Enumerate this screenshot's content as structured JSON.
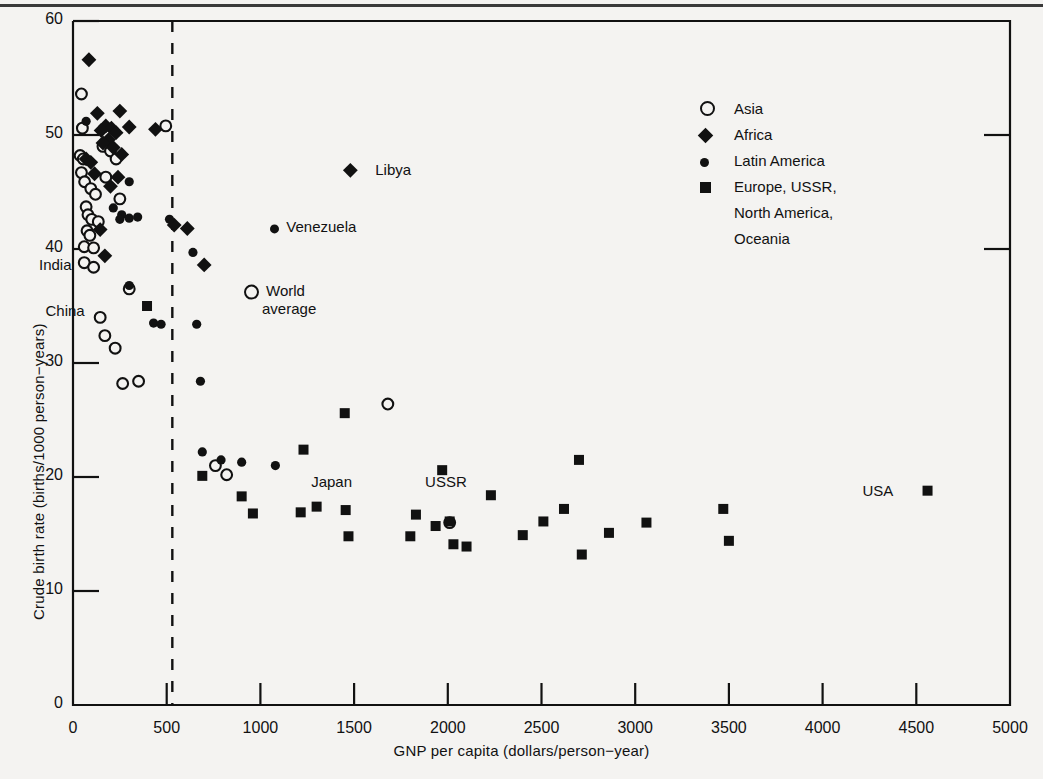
{
  "chart_data": {
    "type": "scatter",
    "title": "",
    "xlabel": "GNP per capita (dollars/person−year)",
    "ylabel": "Crude birth rate (births/1000 person−years)",
    "xlim": [
      0,
      5000
    ],
    "ylim": [
      0,
      60
    ],
    "xticks": [
      0,
      500,
      1000,
      1500,
      2000,
      2500,
      3000,
      3500,
      4000,
      4500,
      5000
    ],
    "yticks": [
      0,
      10,
      20,
      30,
      40,
      50,
      60
    ],
    "grid": false,
    "legend_position": "upper-right",
    "reference_line": {
      "orientation": "vertical",
      "x": 530,
      "style": "dashed"
    },
    "series": [
      {
        "name": "Asia",
        "marker": "open-circle",
        "points": [
          [
            45,
            53.6
          ],
          [
            50,
            50.6
          ],
          [
            38,
            48.2
          ],
          [
            55,
            47.9
          ],
          [
            45,
            46.7
          ],
          [
            62,
            45.9
          ],
          [
            95,
            45.3
          ],
          [
            120,
            44.8
          ],
          [
            70,
            43.7
          ],
          [
            80,
            43.0
          ],
          [
            100,
            42.6
          ],
          [
            135,
            42.4
          ],
          [
            75,
            41.6
          ],
          [
            90,
            41.2
          ],
          [
            60,
            40.2
          ],
          [
            110,
            40.1
          ],
          [
            60,
            38.8
          ],
          [
            110,
            38.4
          ],
          [
            160,
            49.0
          ],
          [
            200,
            48.6
          ],
          [
            230,
            47.9
          ],
          [
            175,
            46.3
          ],
          [
            250,
            44.4
          ],
          [
            145,
            34.0
          ],
          [
            170,
            32.4
          ],
          [
            225,
            31.3
          ],
          [
            265,
            28.2
          ],
          [
            495,
            50.8
          ],
          [
            300,
            36.5
          ],
          [
            350,
            28.4
          ],
          [
            820,
            20.2
          ],
          [
            760,
            21.0
          ],
          [
            1680,
            26.4
          ],
          [
            2010,
            16.0
          ]
        ]
      },
      {
        "name": "Africa",
        "marker": "filled-diamond",
        "points": [
          [
            85,
            56.6
          ],
          [
            130,
            51.9
          ],
          [
            250,
            52.1
          ],
          [
            175,
            50.8
          ],
          [
            205,
            50.6
          ],
          [
            300,
            50.7
          ],
          [
            150,
            50.4
          ],
          [
            230,
            50.2
          ],
          [
            190,
            49.6
          ],
          [
            160,
            49.3
          ],
          [
            215,
            48.9
          ],
          [
            260,
            48.3
          ],
          [
            70,
            47.9
          ],
          [
            95,
            47.6
          ],
          [
            115,
            46.6
          ],
          [
            240,
            46.3
          ],
          [
            200,
            45.5
          ],
          [
            145,
            41.7
          ],
          [
            170,
            39.4
          ],
          [
            440,
            50.5
          ],
          [
            540,
            42.1
          ],
          [
            610,
            41.8
          ],
          [
            700,
            38.6
          ],
          [
            1480,
            46.9
          ]
        ]
      },
      {
        "name": "Latin America",
        "marker": "filled-circle",
        "points": [
          [
            70,
            51.2
          ],
          [
            300,
            45.9
          ],
          [
            215,
            43.6
          ],
          [
            260,
            43.0
          ],
          [
            300,
            42.7
          ],
          [
            345,
            42.8
          ],
          [
            250,
            42.6
          ],
          [
            300,
            36.8
          ],
          [
            430,
            33.5
          ],
          [
            470,
            33.4
          ],
          [
            515,
            42.6
          ],
          [
            640,
            39.7
          ],
          [
            660,
            33.4
          ],
          [
            680,
            28.4
          ],
          [
            690,
            22.2
          ],
          [
            790,
            21.5
          ],
          [
            900,
            21.3
          ],
          [
            1080,
            21.0
          ]
        ]
      },
      {
        "name": "Europe, USSR, North America, Oceania",
        "marker": "filled-square",
        "points": [
          [
            395,
            35.0
          ],
          [
            690,
            20.1
          ],
          [
            900,
            18.3
          ],
          [
            960,
            16.8
          ],
          [
            1230,
            22.4
          ],
          [
            1215,
            16.9
          ],
          [
            1300,
            17.4
          ],
          [
            1450,
            25.6
          ],
          [
            1455,
            17.1
          ],
          [
            1470,
            14.8
          ],
          [
            1800,
            14.8
          ],
          [
            1830,
            16.7
          ],
          [
            1935,
            15.7
          ],
          [
            1970,
            20.6
          ],
          [
            2010,
            16.1
          ],
          [
            2030,
            14.1
          ],
          [
            2100,
            13.9
          ],
          [
            2230,
            18.4
          ],
          [
            2400,
            14.9
          ],
          [
            2510,
            16.1
          ],
          [
            2620,
            17.2
          ],
          [
            2700,
            21.5
          ],
          [
            2715,
            13.2
          ],
          [
            2860,
            15.1
          ],
          [
            3060,
            16.0
          ],
          [
            3470,
            17.2
          ],
          [
            3500,
            14.4
          ],
          [
            4560,
            18.8
          ]
        ]
      }
    ],
    "annotations": [
      {
        "label": "India",
        "x": 35,
        "y": 38.6,
        "align": "right"
      },
      {
        "label": "China",
        "x": 105,
        "y": 34.6,
        "align": "right"
      },
      {
        "label": "World\naverage",
        "x": 870,
        "y": 35.6,
        "align": "left",
        "marker": "open-circle"
      },
      {
        "label": "Venezuela",
        "x": 1010,
        "y": 41.9,
        "align": "left",
        "marker": "filled-circle"
      },
      {
        "label": "Libya",
        "x": 1570,
        "y": 46.9,
        "align": "left"
      },
      {
        "label": "Japan",
        "x": 1380,
        "y": 19.6,
        "align": "center"
      },
      {
        "label": "USSR",
        "x": 1990,
        "y": 19.6,
        "align": "center"
      },
      {
        "label": "USA",
        "x": 4420,
        "y": 18.8,
        "align": "right"
      }
    ]
  },
  "legend": {
    "items": [
      {
        "marker": "open-circle",
        "label": "Asia"
      },
      {
        "marker": "filled-diamond",
        "label": "Africa"
      },
      {
        "marker": "filled-circle",
        "label": "Latin America"
      },
      {
        "marker": "filled-square",
        "label": "Europe, USSR,"
      },
      {
        "marker": "none",
        "label": "North America,"
      },
      {
        "marker": "none",
        "label": "Oceania"
      }
    ]
  },
  "annotation_labels": {
    "india": "India",
    "china": "China",
    "world_average_line1": "World",
    "world_average_line2": "average",
    "venezuela": "Venezuela",
    "libya": "Libya",
    "japan": "Japan",
    "ussr": "USSR",
    "usa": "USA"
  },
  "colors": {
    "ink": "#111111",
    "paper": "#f4f3f1",
    "marker": "#111111"
  }
}
